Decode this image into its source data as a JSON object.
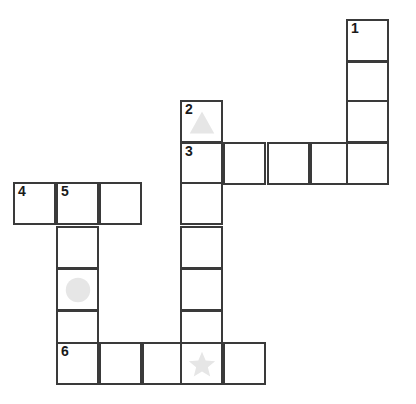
{
  "puzzle": {
    "title": "Crossword Grid",
    "cell_size": 43,
    "colors": {
      "cell_fill": "#ffffff",
      "cell_border": "#3a3a3a",
      "number": "#1a1a1a",
      "shape": "#e6e6e6",
      "background": "#ffffff"
    },
    "columns": [
      13,
      56,
      99,
      142,
      180,
      223,
      267,
      310,
      346
    ],
    "rows": [
      19,
      61,
      100,
      142,
      182,
      226,
      268,
      310,
      342
    ],
    "clue_numbers": [
      "1",
      "2",
      "3",
      "4",
      "5",
      "6"
    ],
    "shape_icons": [
      "triangle",
      "circle",
      "star"
    ],
    "cells": [
      {
        "id": "cell-1",
        "col": 8,
        "row": 0,
        "number": "1",
        "shape": ""
      },
      {
        "id": "cell-c8r1",
        "col": 8,
        "row": 1,
        "number": "",
        "shape": ""
      },
      {
        "id": "cell-c8r2",
        "col": 8,
        "row": 2,
        "number": "",
        "shape": ""
      },
      {
        "id": "cell-2",
        "col": 4,
        "row": 2,
        "number": "2",
        "shape": "triangle"
      },
      {
        "id": "cell-3",
        "col": 4,
        "row": 3,
        "number": "3",
        "shape": ""
      },
      {
        "id": "cell-c5r3",
        "col": 5,
        "row": 3,
        "number": "",
        "shape": ""
      },
      {
        "id": "cell-c6r3",
        "col": 6,
        "row": 3,
        "number": "",
        "shape": ""
      },
      {
        "id": "cell-c7r3",
        "col": 7,
        "row": 3,
        "number": "",
        "shape": ""
      },
      {
        "id": "cell-c8r3",
        "col": 8,
        "row": 3,
        "number": "",
        "shape": ""
      },
      {
        "id": "cell-4",
        "col": 0,
        "row": 4,
        "number": "4",
        "shape": ""
      },
      {
        "id": "cell-5",
        "col": 1,
        "row": 4,
        "number": "5",
        "shape": ""
      },
      {
        "id": "cell-c2r4",
        "col": 2,
        "row": 4,
        "number": "",
        "shape": ""
      },
      {
        "id": "cell-c4r4",
        "col": 4,
        "row": 4,
        "number": "",
        "shape": ""
      },
      {
        "id": "cell-c1r5",
        "col": 1,
        "row": 5,
        "number": "",
        "shape": ""
      },
      {
        "id": "cell-c4r5",
        "col": 4,
        "row": 5,
        "number": "",
        "shape": ""
      },
      {
        "id": "cell-c1r6",
        "col": 1,
        "row": 6,
        "number": "",
        "shape": "circle"
      },
      {
        "id": "cell-c4r6",
        "col": 4,
        "row": 6,
        "number": "",
        "shape": ""
      },
      {
        "id": "cell-c1r7",
        "col": 1,
        "row": 7,
        "number": "",
        "shape": ""
      },
      {
        "id": "cell-c4r7",
        "col": 4,
        "row": 7,
        "number": "",
        "shape": ""
      },
      {
        "id": "cell-6",
        "col": 1,
        "row": 8,
        "number": "6",
        "shape": ""
      },
      {
        "id": "cell-c2r8",
        "col": 2,
        "row": 8,
        "number": "",
        "shape": ""
      },
      {
        "id": "cell-c3r8",
        "col": 3,
        "row": 8,
        "number": "",
        "shape": ""
      },
      {
        "id": "cell-c4r8",
        "col": 4,
        "row": 8,
        "number": "",
        "shape": "star"
      },
      {
        "id": "cell-c5r8",
        "col": 5,
        "row": 8,
        "number": "",
        "shape": ""
      }
    ]
  }
}
